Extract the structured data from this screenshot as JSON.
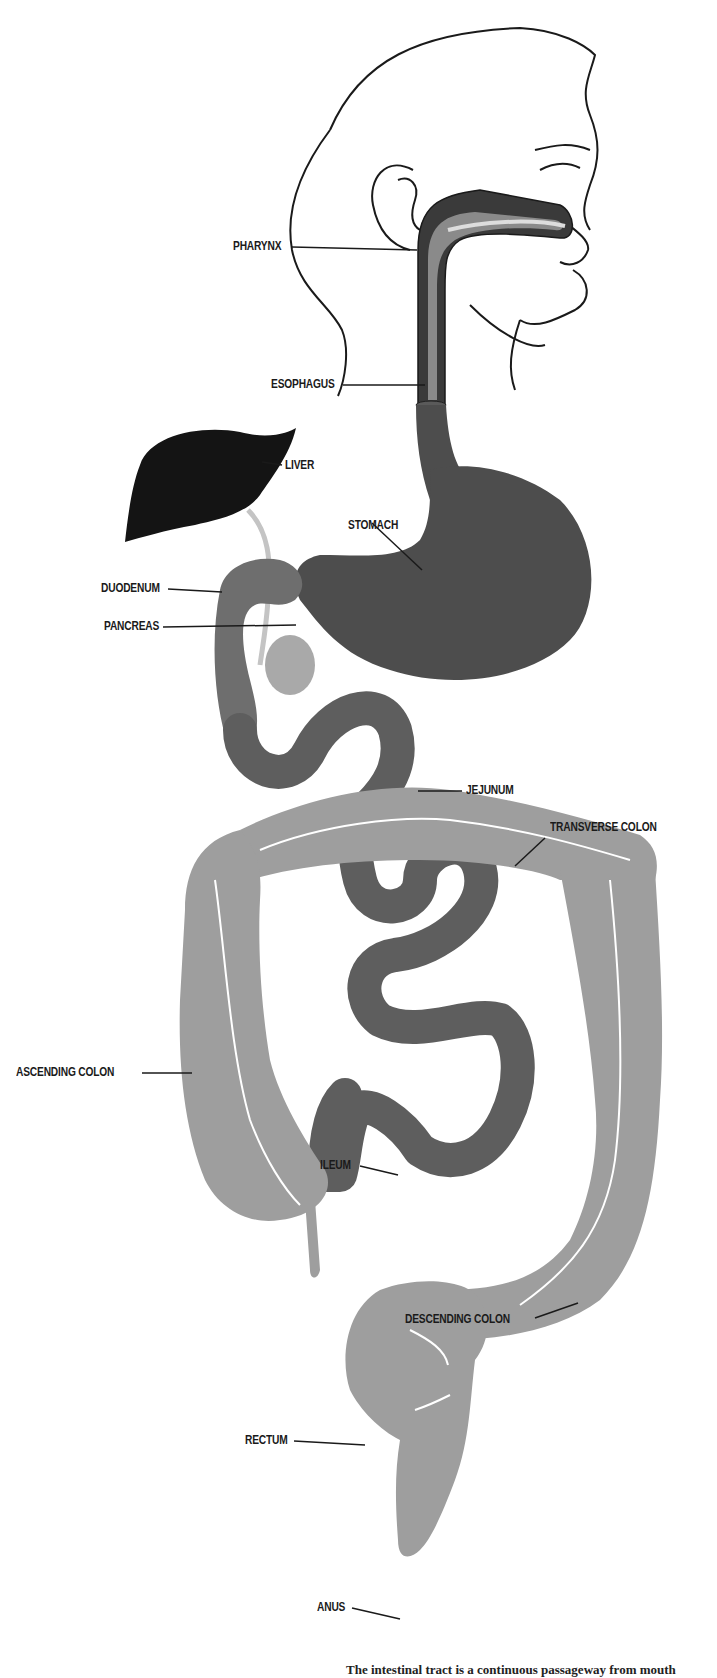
{
  "figure": {
    "colors": {
      "background": "#ffffff",
      "outline": "#1a1a1a",
      "liver": "#141414",
      "stomach": "#4d4d4d",
      "small_intestine": "#5e5e5e",
      "duodenum": "#6e6e6e",
      "pancreas": "#a9a9a9",
      "colon": "#9e9e9e",
      "bile_duct": "#c4c4c4"
    },
    "labels": {
      "pharynx": "PHARYNX",
      "esophagus": "ESOPHAGUS",
      "liver": "LIVER",
      "stomach": "STOMACH",
      "duodenum": "DUODENUM",
      "pancreas": "PANCREAS",
      "jejunum": "JEJUNUM",
      "transverse_colon": "TRANSVERSE  COLON",
      "ascending_colon": "ASCENDING  COLON",
      "ileum": "ILEUM",
      "descending_colon": "DESCENDING  COLON",
      "rectum": "RECTUM",
      "anus": "ANUS"
    },
    "caption": "The intestinal tract is a continuous passageway from mouth"
  }
}
